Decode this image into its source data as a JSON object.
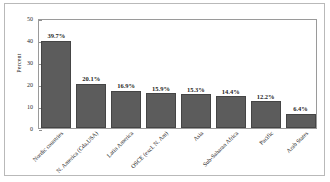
{
  "chart_data": {
    "type": "bar",
    "title": "",
    "subtitle": "",
    "xlabel": "",
    "ylabel": "Percent",
    "ylim": [
      0,
      50
    ],
    "yticks": [
      0,
      10,
      20,
      30,
      40,
      50
    ],
    "ytick_labels": [
      "0",
      "10",
      "20",
      "30",
      "40",
      "50"
    ],
    "grid": false,
    "legend": false,
    "legend_position": "none",
    "orientation": "vertical",
    "bar_color": "#5c5c5c",
    "bar_edge_color": "#454545",
    "categories": [
      "Nordic countries",
      "N. America (Cda,USA)",
      "Latin America",
      "OSCE (excl. N. Am)",
      "Asia",
      "Sub-Saharan Africa",
      "Pacific",
      "Arab States"
    ],
    "values": [
      39.7,
      20.1,
      16.9,
      15.9,
      15.3,
      14.4,
      12.2,
      6.4
    ],
    "data_labels": [
      "39.7%",
      "20.1%",
      "16.9%",
      "15.9%",
      "15.3%",
      "14.4%",
      "12.2%",
      "6.4%"
    ],
    "annotations": []
  }
}
